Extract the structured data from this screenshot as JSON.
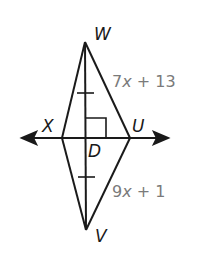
{
  "diagram": {
    "type": "geometry-kite",
    "vertices": {
      "W": {
        "label": "W"
      },
      "X": {
        "label": "X"
      },
      "U": {
        "label": "U"
      },
      "V": {
        "label": "V"
      },
      "D": {
        "label": "D"
      }
    },
    "edge_labels": {
      "WU": {
        "coef": "7",
        "var": "x",
        "rest": " + 13"
      },
      "UV": {
        "coef": "9",
        "var": "x",
        "rest": " + 1"
      }
    },
    "markings": {
      "right_angle_at": "D",
      "congruent_ticks": [
        "WD",
        "DV"
      ],
      "line_through": "XU (line with arrows both ends)"
    },
    "colors": {
      "stroke": "#1a1a1a",
      "edge_label": "#7a7a7a",
      "background": "#ffffff"
    }
  }
}
